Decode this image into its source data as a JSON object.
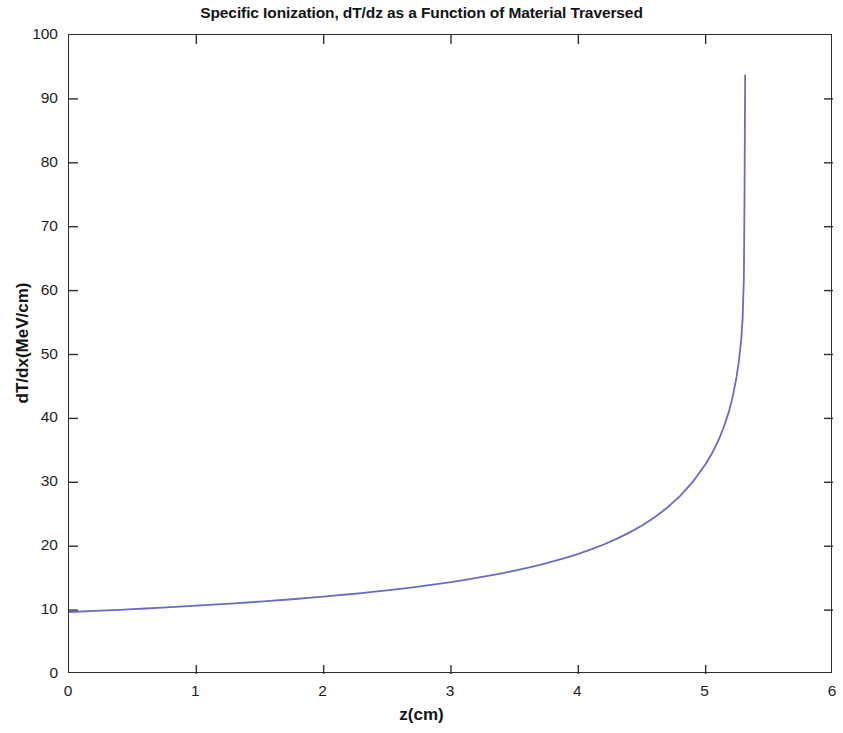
{
  "chart_data": {
    "type": "line",
    "title": "Specific Ionization, dT/dz as a Function of Material Traversed",
    "xlabel": "z(cm)",
    "ylabel": "dT/dx(MeV/cm)",
    "xlim": [
      0,
      6
    ],
    "ylim": [
      0,
      100
    ],
    "xticks": [
      0,
      1,
      2,
      3,
      4,
      5,
      6
    ],
    "yticks": [
      0,
      10,
      20,
      30,
      40,
      50,
      60,
      70,
      80,
      90,
      100
    ],
    "xtick_labels": [
      "0",
      "1",
      "2",
      "3",
      "4",
      "5",
      "6"
    ],
    "ytick_labels": [
      "0",
      "10",
      "20",
      "30",
      "40",
      "50",
      "60",
      "70",
      "80",
      "90",
      "100"
    ],
    "grid": false,
    "legend": null,
    "line_color": "#6b6bc4",
    "line_width": 1.8,
    "series": [
      {
        "name": "dT/dx",
        "x": [
          0.0,
          0.1,
          0.2,
          0.3,
          0.4,
          0.5,
          0.6,
          0.7,
          0.8,
          0.9,
          1.0,
          1.1,
          1.2,
          1.3,
          1.4,
          1.5,
          1.6,
          1.7,
          1.8,
          1.9,
          2.0,
          2.1,
          2.2,
          2.3,
          2.4,
          2.5,
          2.6,
          2.7,
          2.8,
          2.9,
          3.0,
          3.1,
          3.2,
          3.3,
          3.4,
          3.5,
          3.6,
          3.7,
          3.8,
          3.9,
          4.0,
          4.1,
          4.2,
          4.3,
          4.4,
          4.5,
          4.6,
          4.7,
          4.8,
          4.9,
          5.0,
          5.05,
          5.1,
          5.14,
          5.18,
          5.21,
          5.24,
          5.26,
          5.28,
          5.29,
          5.3,
          5.305,
          5.31
        ],
        "y": [
          9.7,
          9.78,
          9.87,
          9.96,
          10.05,
          10.15,
          10.25,
          10.35,
          10.46,
          10.57,
          10.69,
          10.81,
          10.93,
          11.06,
          11.19,
          11.33,
          11.47,
          11.62,
          11.78,
          11.94,
          12.11,
          12.29,
          12.48,
          12.67,
          12.88,
          13.1,
          13.33,
          13.57,
          13.83,
          14.1,
          14.39,
          14.7,
          15.03,
          15.38,
          15.76,
          16.17,
          16.61,
          17.09,
          17.61,
          18.18,
          18.81,
          19.5,
          20.27,
          21.14,
          22.12,
          23.24,
          24.54,
          26.06,
          27.88,
          30.09,
          32.86,
          34.55,
          36.55,
          38.5,
          40.9,
          43.2,
          46.2,
          48.8,
          52.5,
          55.5,
          62.0,
          74.0,
          93.7
        ]
      }
    ],
    "annotations": [],
    "peak": {
      "x": 5.31,
      "y": 93.7
    }
  },
  "figure": {
    "title": "Specific Ionization, dT/dz as a Function of Material Traversed",
    "x_axis_label": "z(cm)",
    "y_axis_label": "dT/dx(MeV/cm)"
  }
}
